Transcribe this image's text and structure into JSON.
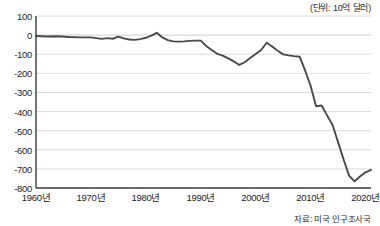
{
  "caption": {
    "unit": "(단위: 10억 달러)",
    "source": "자료: 미국 인구조사국"
  },
  "axis": {
    "y_ticks": [
      "100",
      "0",
      "-100",
      "-200",
      "-300",
      "-400",
      "-500",
      "-600",
      "-700",
      "-800"
    ],
    "x_ticks": [
      "1960년",
      "1970년",
      "1980년",
      "1990년",
      "2000년",
      "2010년",
      "2020년"
    ]
  },
  "style": {
    "line_color": "#4a4a4a",
    "grid_color": "#d8d8d8",
    "axis_color": "#3a3a3a",
    "background": "#ffffff"
  },
  "chart_data": {
    "type": "line",
    "title": "",
    "subtitle": "",
    "xlabel": "",
    "ylabel": "",
    "unit": "10억 달러",
    "source": "미국 인구조사국",
    "xlim": [
      1960,
      2021
    ],
    "ylim": [
      -800,
      100
    ],
    "ytick_step": 100,
    "grid": true,
    "legend": "none",
    "categories": [
      1960,
      1961,
      1962,
      1963,
      1964,
      1965,
      1966,
      1967,
      1968,
      1969,
      1970,
      1971,
      1972,
      1973,
      1974,
      1975,
      1976,
      1977,
      1978,
      1979,
      1980,
      1981,
      1982,
      1983,
      1984,
      1985,
      1986,
      1987,
      1988,
      1989,
      1990,
      1991,
      1992,
      1993,
      1994,
      1995,
      1996,
      1997,
      1998,
      1999,
      2000,
      2001,
      2002,
      2003,
      2004,
      2005,
      2006,
      2007,
      2008,
      2009,
      2010,
      2011,
      2012,
      2013,
      2014,
      2015,
      2016,
      2017,
      2018,
      2019,
      2020,
      2021
    ],
    "values": [
      -4,
      -4,
      -5,
      -5,
      -4,
      -6,
      -7,
      -7,
      -8,
      -8,
      -9,
      -11,
      -13,
      -12,
      -13,
      -11,
      -14,
      -20,
      -22,
      -20,
      -18,
      -19,
      -28,
      -40,
      -33,
      -36,
      -46,
      -57,
      -42,
      -42,
      -33,
      -7,
      -20,
      -39,
      -63,
      -62,
      -63,
      -62,
      -77,
      -100,
      -133,
      -126,
      -151,
      -172,
      -203,
      -231,
      -243,
      -223,
      -197,
      -110,
      -129,
      -150,
      -144,
      -128,
      -132,
      -143,
      -138,
      -148,
      -153,
      -148,
      -162,
      -178
    ],
    "values_billions_usd": [
      -4,
      -4,
      -5,
      -5,
      -4,
      -6,
      -7,
      -7,
      -8,
      -8,
      -9,
      -11,
      -13,
      -12,
      -13,
      -11,
      -14,
      -20,
      -22,
      -20,
      -18,
      -19,
      -28,
      -40,
      -33,
      -36,
      -46,
      -57,
      -42,
      -42,
      -33,
      -7,
      -20,
      -39,
      -63,
      -62,
      -63,
      -62,
      -77,
      -100,
      -133,
      -126,
      -151,
      -172,
      -203,
      -231,
      -243,
      -223,
      -197,
      -110,
      -129,
      -150,
      -144,
      -128,
      -132,
      -143,
      -138,
      -148,
      -153,
      -148,
      -162,
      -178
    ],
    "plotted_series": [
      {
        "name": "미국 무역수지",
        "points": [
          {
            "x": 1960,
            "y": -5
          },
          {
            "x": 1961,
            "y": -5
          },
          {
            "x": 1962,
            "y": -7
          },
          {
            "x": 1963,
            "y": -7
          },
          {
            "x": 1964,
            "y": -6
          },
          {
            "x": 1965,
            "y": -8
          },
          {
            "x": 1966,
            "y": -10
          },
          {
            "x": 1967,
            "y": -10
          },
          {
            "x": 1968,
            "y": -12
          },
          {
            "x": 1969,
            "y": -12
          },
          {
            "x": 1970,
            "y": -12
          },
          {
            "x": 1971,
            "y": -16
          },
          {
            "x": 1972,
            "y": -20
          },
          {
            "x": 1973,
            "y": -16
          },
          {
            "x": 1974,
            "y": -18
          },
          {
            "x": 1975,
            "y": -8
          },
          {
            "x": 1976,
            "y": -16
          },
          {
            "x": 1977,
            "y": -22
          },
          {
            "x": 1978,
            "y": -24
          },
          {
            "x": 1979,
            "y": -20
          },
          {
            "x": 1980,
            "y": -14
          },
          {
            "x": 1981,
            "y": -4
          },
          {
            "x": 1982,
            "y": 12
          },
          {
            "x": 1983,
            "y": -10
          },
          {
            "x": 1984,
            "y": -24
          },
          {
            "x": 1985,
            "y": -32
          },
          {
            "x": 1986,
            "y": -33
          },
          {
            "x": 1987,
            "y": -32
          },
          {
            "x": 1988,
            "y": -30
          },
          {
            "x": 1989,
            "y": -28
          },
          {
            "x": 1990,
            "y": -28
          },
          {
            "x": 1991,
            "y": -55
          },
          {
            "x": 1992,
            "y": -75
          },
          {
            "x": 1993,
            "y": -95
          },
          {
            "x": 1994,
            "y": -105
          },
          {
            "x": 1995,
            "y": -120
          },
          {
            "x": 1996,
            "y": -135
          },
          {
            "x": 1997,
            "y": -155
          },
          {
            "x": 1998,
            "y": -140
          },
          {
            "x": 1999,
            "y": -120
          },
          {
            "x": 2000,
            "y": -100
          },
          {
            "x": 2001,
            "y": -80
          },
          {
            "x": 2002,
            "y": -40
          },
          {
            "x": 2003,
            "y": -60
          },
          {
            "x": 2004,
            "y": -80
          },
          {
            "x": 2005,
            "y": -100
          },
          {
            "x": 2006,
            "y": -105
          },
          {
            "x": 2007,
            "y": -110
          },
          {
            "x": 2008,
            "y": -112
          },
          {
            "x": 2009,
            "y": -180
          },
          {
            "x": 2010,
            "y": -260
          },
          {
            "x": 2011,
            "y": -370
          },
          {
            "x": 2012,
            "y": -420
          },
          {
            "x": 2013,
            "y": -415
          },
          {
            "x": 2014,
            "y": -470
          },
          {
            "x": 2015,
            "y": -560
          },
          {
            "x": 2016,
            "y": -640
          },
          {
            "x": 2017,
            "y": -730
          },
          {
            "x": 2018,
            "y": -765
          },
          {
            "x": 2019,
            "y": -720
          },
          {
            "x": 2020,
            "y": -710
          },
          {
            "x": 2021,
            "y": -700
          }
        ]
      }
    ],
    "annotations": [
      {
        "label": "1960년대 균형에 가까운 소폭 적자",
        "value": -5
      },
      {
        "label": "1991년 일시적 적자 축소",
        "value": -30
      },
      {
        "label": "1997년 국지적 저점",
        "value": -155
      },
      {
        "label": "2006년 최저점",
        "value": -765
      },
      {
        "label": "2009년 급반등 고점",
        "value": -395
      },
      {
        "label": "2021년 최종값",
        "value": -680
      }
    ]
  },
  "curve": {
    "path_points": [
      [
        1960,
        -5
      ],
      [
        1962,
        -7
      ],
      [
        1964,
        -6
      ],
      [
        1966,
        -10
      ],
      [
        1968,
        -12
      ],
      [
        1970,
        -12
      ],
      [
        1971,
        -16
      ],
      [
        1972,
        -20
      ],
      [
        1973,
        -16
      ],
      [
        1974,
        -19
      ],
      [
        1975,
        -8
      ],
      [
        1976,
        -17
      ],
      [
        1977,
        -23
      ],
      [
        1978,
        -25
      ],
      [
        1979,
        -21
      ],
      [
        1980,
        -14
      ],
      [
        1981,
        -3
      ],
      [
        1982,
        12
      ],
      [
        1983,
        -12
      ],
      [
        1984,
        -26
      ],
      [
        1985,
        -33
      ],
      [
        1986,
        -34
      ],
      [
        1987,
        -33
      ],
      [
        1988,
        -30
      ],
      [
        1989,
        -29
      ],
      [
        1990,
        -29
      ],
      [
        1991,
        -57
      ],
      [
        1992,
        -78
      ],
      [
        1993,
        -98
      ],
      [
        1994,
        -107
      ],
      [
        1995,
        -122
      ],
      [
        1996,
        -137
      ],
      [
        1997,
        -156
      ],
      [
        1998,
        -142
      ],
      [
        1999,
        -120
      ],
      [
        2000,
        -99
      ],
      [
        2001,
        -78
      ],
      [
        2002,
        -40
      ],
      [
        2003,
        -60
      ],
      [
        2004,
        -82
      ],
      [
        2005,
        -101
      ],
      [
        2006,
        -106
      ],
      [
        2007,
        -110
      ],
      [
        2008,
        -113
      ],
      [
        2009,
        -185
      ],
      [
        2010,
        -265
      ],
      [
        2011,
        -372
      ],
      [
        2012,
        -368
      ],
      [
        2013,
        -420
      ],
      [
        2014,
        -470
      ],
      [
        2015,
        -560
      ],
      [
        2016,
        -650
      ],
      [
        2017,
        -735
      ],
      [
        2018,
        -765
      ],
      [
        2019,
        -740
      ],
      [
        2020,
        -718
      ],
      [
        2021,
        -705
      ]
    ]
  }
}
